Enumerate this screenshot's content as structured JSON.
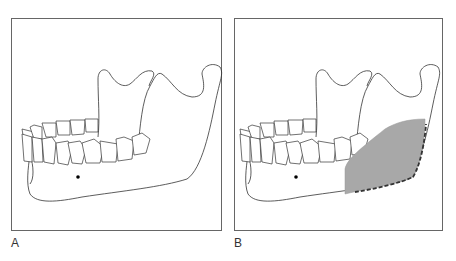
{
  "figure": {
    "panels": [
      {
        "id": "A",
        "label": "A",
        "description": "Lateral view of mandible with teeth, mental foramen dot"
      },
      {
        "id": "B",
        "label": "B",
        "description": "Lateral view of mandible with shaded region over angle/ramus and dashed line along posterior-inferior border"
      }
    ],
    "colors": {
      "outline": "#333333",
      "shaded_region": "#a8a8a8",
      "dashed_line": "#333333",
      "frame": "#666666"
    }
  }
}
